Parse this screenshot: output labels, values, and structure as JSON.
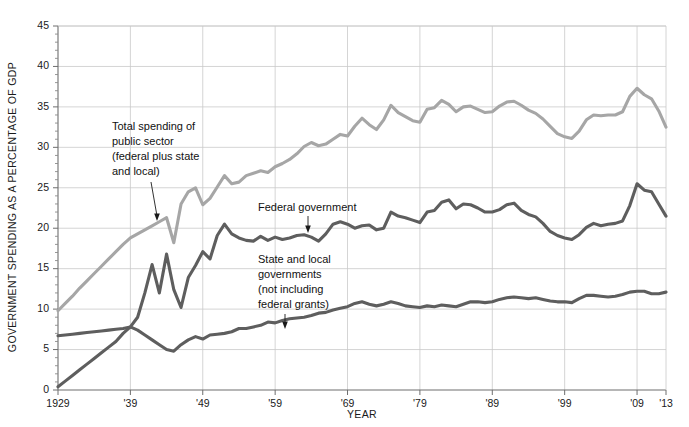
{
  "chart_data": {
    "type": "line",
    "title": "",
    "xlabel": "YEAR",
    "ylabel": "GOVERNMENT SPENDING AS A PERCENTAGE OF GDP",
    "xlim": [
      1929,
      2013
    ],
    "ylim": [
      0,
      45
    ],
    "grid": true,
    "legend_position": "inline-annotations",
    "y_ticks": [
      0,
      5,
      10,
      15,
      20,
      25,
      30,
      35,
      40,
      45
    ],
    "y_tick_labels": [
      "0",
      "5",
      "10",
      "15",
      "20",
      "25",
      "30",
      "35",
      "40",
      "45"
    ],
    "x_ticks": [
      1929,
      1939,
      1949,
      1959,
      1969,
      1979,
      1989,
      1999,
      2009,
      2013
    ],
    "x_tick_labels": [
      "1929",
      "'39",
      "'49",
      "'59",
      "'69",
      "'79",
      "'89",
      "'99",
      "'09",
      "'13"
    ],
    "x": [
      1929,
      1930,
      1931,
      1932,
      1933,
      1934,
      1935,
      1936,
      1937,
      1938,
      1939,
      1940,
      1941,
      1942,
      1943,
      1944,
      1945,
      1946,
      1947,
      1948,
      1949,
      1950,
      1951,
      1952,
      1953,
      1954,
      1955,
      1956,
      1957,
      1958,
      1959,
      1960,
      1961,
      1962,
      1963,
      1964,
      1965,
      1966,
      1967,
      1968,
      1969,
      1970,
      1971,
      1972,
      1973,
      1974,
      1975,
      1976,
      1977,
      1978,
      1979,
      1980,
      1981,
      1982,
      1983,
      1984,
      1985,
      1986,
      1987,
      1988,
      1989,
      1990,
      1991,
      1992,
      1993,
      1994,
      1995,
      1996,
      1997,
      1998,
      1999,
      2000,
      2001,
      2002,
      2003,
      2004,
      2005,
      2006,
      2007,
      2008,
      2009,
      2010,
      2011,
      2012,
      2013
    ],
    "series": [
      {
        "name": "Total spending of public sector (federal plus state and local)",
        "color": "#a6a6a6",
        "values": [
          9.8,
          10.7,
          11.6,
          12.6,
          13.5,
          14.4,
          15.3,
          16.2,
          17.1,
          18.0,
          18.8,
          19.3,
          19.8,
          20.3,
          20.8,
          21.3,
          18.2,
          23.0,
          24.5,
          25.0,
          22.9,
          23.7,
          25.1,
          26.5,
          25.5,
          25.7,
          26.5,
          26.8,
          27.1,
          26.9,
          27.6,
          28.0,
          28.5,
          29.2,
          30.1,
          30.6,
          30.2,
          30.4,
          31.0,
          31.6,
          31.4,
          32.6,
          33.6,
          32.8,
          32.2,
          33.4,
          35.2,
          34.3,
          33.8,
          33.3,
          33.1,
          34.7,
          34.9,
          35.8,
          35.3,
          34.4,
          35.0,
          35.1,
          34.7,
          34.3,
          34.4,
          35.1,
          35.6,
          35.7,
          35.2,
          34.6,
          34.2,
          33.5,
          32.6,
          31.7,
          31.3,
          31.1,
          32.0,
          33.4,
          34.0,
          33.9,
          34.0,
          34.0,
          34.4,
          36.3,
          37.3,
          36.5,
          36.0,
          34.5,
          32.5
        ]
      },
      {
        "name": "Federal government",
        "color": "#5e5e5e",
        "values": [
          0.4,
          1.1,
          1.8,
          2.5,
          3.2,
          3.9,
          4.6,
          5.3,
          6.0,
          7.0,
          7.8,
          9.0,
          12.0,
          15.5,
          12.0,
          16.8,
          12.4,
          10.2,
          13.9,
          15.4,
          17.1,
          16.2,
          19.1,
          20.5,
          19.3,
          18.8,
          18.5,
          18.4,
          19.0,
          18.5,
          18.9,
          18.6,
          18.8,
          19.1,
          19.2,
          18.9,
          18.4,
          19.3,
          20.5,
          20.8,
          20.5,
          20.0,
          20.3,
          20.4,
          19.8,
          20.0,
          22.0,
          21.5,
          21.3,
          21.0,
          20.7,
          22.0,
          22.2,
          23.2,
          23.5,
          22.4,
          23.0,
          22.9,
          22.5,
          22.0,
          22.0,
          22.3,
          22.9,
          23.1,
          22.2,
          21.7,
          21.4,
          20.6,
          19.6,
          19.1,
          18.8,
          18.6,
          19.2,
          20.1,
          20.6,
          20.3,
          20.5,
          20.6,
          20.9,
          22.8,
          25.5,
          24.7,
          24.5,
          23.0,
          21.5
        ]
      },
      {
        "name": "State and local governments (not including federal grants)",
        "color": "#5e5e5e",
        "values": [
          6.7,
          6.8,
          6.9,
          7.0,
          7.1,
          7.2,
          7.3,
          7.4,
          7.5,
          7.6,
          7.8,
          7.4,
          6.8,
          6.2,
          5.6,
          5.0,
          4.8,
          5.6,
          6.2,
          6.6,
          6.3,
          6.8,
          6.9,
          7.0,
          7.2,
          7.6,
          7.6,
          7.8,
          8.0,
          8.4,
          8.3,
          8.6,
          8.8,
          8.9,
          9.0,
          9.2,
          9.5,
          9.6,
          9.9,
          10.1,
          10.3,
          10.7,
          10.9,
          10.6,
          10.4,
          10.6,
          10.9,
          10.7,
          10.4,
          10.3,
          10.2,
          10.4,
          10.3,
          10.5,
          10.4,
          10.3,
          10.6,
          10.9,
          10.9,
          10.8,
          10.9,
          11.2,
          11.4,
          11.5,
          11.4,
          11.3,
          11.4,
          11.2,
          11.0,
          10.9,
          10.9,
          10.8,
          11.3,
          11.7,
          11.7,
          11.6,
          11.5,
          11.6,
          11.8,
          12.1,
          12.2,
          12.2,
          11.9,
          11.9,
          12.1
        ]
      }
    ],
    "annotations": [
      {
        "id": "annot-total",
        "lines": [
          "Total spending of",
          "public sector",
          "(federal plus state",
          "and local)"
        ],
        "text": "Total spending of public sector (federal plus state and local)"
      },
      {
        "id": "annot-federal",
        "lines": [
          "Federal government"
        ],
        "text": "Federal government"
      },
      {
        "id": "annot-statelocal",
        "lines": [
          "State and local",
          "governments",
          "(not including",
          "federal grants)"
        ],
        "text": "State and local governments (not including federal grants)"
      }
    ]
  },
  "colors": {
    "total_line": "#a6a6a6",
    "federal_line": "#5e5e5e",
    "statelocal_line": "#5e5e5e",
    "grid": "#c9c9c9",
    "axis": "#6e6e6e",
    "text": "#1a1a1a",
    "background": "#ffffff"
  }
}
